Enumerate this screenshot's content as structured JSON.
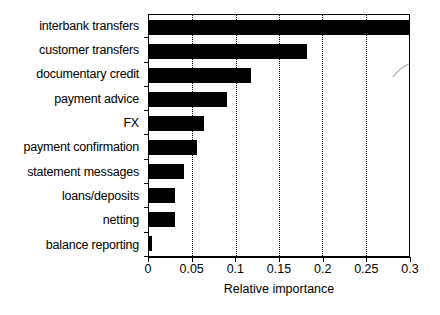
{
  "chart_data": {
    "type": "bar",
    "orientation": "horizontal",
    "title": "",
    "xlabel": "Relative importance",
    "ylabel": "",
    "xlim": [
      0,
      0.3
    ],
    "ylim": null,
    "grid": "vertical-dotted",
    "legend": "none",
    "categories": [
      "interbank transfers",
      "customer transfers",
      "documentary credit",
      "payment advice",
      "FX",
      "payment confirmation",
      "statement messages",
      "loans/deposits",
      "netting",
      "balance reporting"
    ],
    "values": [
      0.3,
      0.182,
      0.118,
      0.09,
      0.063,
      0.055,
      0.04,
      0.03,
      0.03,
      0.003
    ],
    "xticks": [
      0,
      0.05,
      0.1,
      0.15,
      0.2,
      0.25,
      0.3
    ],
    "xtick_labels": [
      "0",
      "0.05",
      "0.1",
      "0.15",
      "0.2",
      "0.25",
      "0.3"
    ],
    "bar_color": "#000000",
    "background_color": "#ffffff"
  }
}
